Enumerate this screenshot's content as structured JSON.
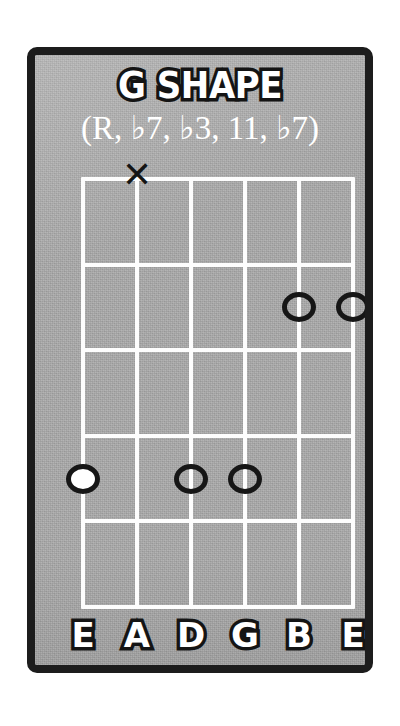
{
  "card": {
    "title": "G SHAPE",
    "subtitle": "(R, ♭7, ♭3, 11, ♭7)",
    "background_color": "#a8a8a8",
    "border_color": "#1c1c1c",
    "grid_color": "#fdfdfd",
    "marker_color": "#161616",
    "root_fill_color": "#ffffff"
  },
  "diagram": {
    "type": "guitar-chord-diagram",
    "string_count": 6,
    "fret_rows": 5,
    "strings": [
      {
        "index": 0,
        "label": "E",
        "name": "low-e"
      },
      {
        "index": 1,
        "label": "A",
        "name": "a"
      },
      {
        "index": 2,
        "label": "D",
        "name": "d"
      },
      {
        "index": 3,
        "label": "G",
        "name": "g"
      },
      {
        "index": 4,
        "label": "B",
        "name": "b"
      },
      {
        "index": 5,
        "label": "E",
        "name": "high-e"
      }
    ],
    "string_labels": [
      "E",
      "A",
      "D",
      "G",
      "B",
      "E"
    ],
    "mutes": [
      {
        "string": 1,
        "symbol": "✕",
        "label": "muted-a-string"
      }
    ],
    "dots": [
      {
        "string": 4,
        "fret": 2,
        "filled": false,
        "interval": "♭7"
      },
      {
        "string": 5,
        "fret": 2,
        "filled": false,
        "interval": "♭7"
      },
      {
        "string": 0,
        "fret": 4,
        "filled": true,
        "interval": "R"
      },
      {
        "string": 2,
        "fret": 4,
        "filled": false,
        "interval": "♭3"
      },
      {
        "string": 3,
        "fret": 4,
        "filled": false,
        "interval": "11"
      }
    ],
    "intervals": [
      "R",
      "♭7",
      "♭3",
      "11",
      "♭7"
    ]
  }
}
